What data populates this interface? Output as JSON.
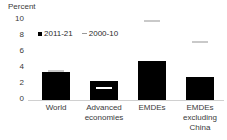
{
  "chart_data": {
    "type": "bar",
    "title": "",
    "subtitle": "",
    "xlabel": "",
    "ylabel": "Percent",
    "ylim": [
      0,
      10
    ],
    "yticks": [
      10,
      8,
      6,
      4,
      2,
      0
    ],
    "grid": false,
    "legend_position": "top-left",
    "categories": [
      "World",
      "Advanced economies",
      "EMDEs",
      "EMDEs excluding China"
    ],
    "series": [
      {
        "name": "2011-21",
        "marker": "square",
        "color": "#000000",
        "values": [
          3.5,
          2.4,
          4.8,
          2.8
        ]
      },
      {
        "name": "2000-10",
        "marker": "dash",
        "color": "#c9c9c9",
        "values": [
          3.5,
          1.3,
          9.6,
          7.0
        ]
      }
    ]
  },
  "axis": {
    "y_title": "Percent",
    "ticks": [
      "10",
      "8",
      "6",
      "4",
      "2",
      "0"
    ]
  },
  "legend": {
    "items": [
      {
        "label": "2011-21"
      },
      {
        "label": "2000-10"
      }
    ]
  },
  "categories": {
    "world": "World",
    "advanced": "Advanced\neconomies",
    "advanced_line1": "Advanced",
    "advanced_line2": "economies",
    "emdes": "EMDEs",
    "emdes_ex_china_line1": "EMDEs",
    "emdes_ex_china_line2": "excluding",
    "emdes_ex_china_line3": "China"
  }
}
